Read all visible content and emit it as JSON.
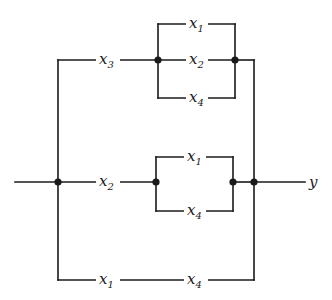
{
  "diagram": {
    "type": "switching-network",
    "output_label": "y",
    "colors": {
      "line": "#1a1a1a",
      "background": "#ffffff"
    },
    "branches": {
      "top": {
        "series": {
          "var": "x",
          "sub": "3"
        },
        "parallel": [
          {
            "var": "x",
            "sub": "1"
          },
          {
            "var": "x",
            "sub": "2"
          },
          {
            "var": "x",
            "sub": "4"
          }
        ]
      },
      "middle": {
        "series": {
          "var": "x",
          "sub": "2"
        },
        "parallel": [
          {
            "var": "x",
            "sub": "1"
          },
          {
            "var": "x",
            "sub": "4"
          }
        ]
      },
      "bottom": {
        "series": [
          {
            "var": "x",
            "sub": "1"
          },
          {
            "var": "x",
            "sub": "4"
          }
        ]
      }
    }
  }
}
